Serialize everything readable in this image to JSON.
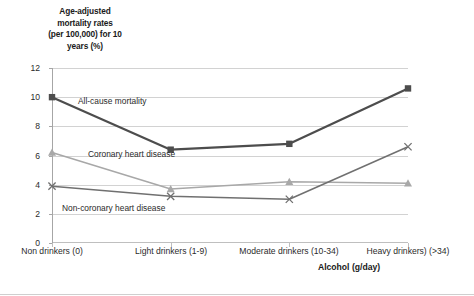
{
  "chart_data": {
    "type": "line",
    "title": "",
    "ylabel": "Age-adjusted mortality rates (per 100,000) for 10 years (%)",
    "ylabel_lines": [
      "Age-adjusted",
      "mortality rates",
      "(per 100,000) for 10",
      "years (%)"
    ],
    "xlabel": "Alcohol (g/day)",
    "categories": [
      "Non drinkers (0)",
      "Light drinkers (1-9)",
      "Moderate drinkers (10-34)",
      "Heavy drinkers) (>34)"
    ],
    "ylim": [
      0,
      12
    ],
    "yticks": [
      0,
      2,
      4,
      6,
      8,
      10,
      12
    ],
    "grid": true,
    "legend_position": "inline-annotations",
    "series": [
      {
        "name": "All-cause mortality",
        "marker": "square",
        "color": "#4d4d4d",
        "values": [
          10.0,
          6.4,
          6.8,
          10.6
        ]
      },
      {
        "name": "Coronary heart disease",
        "marker": "triangle",
        "color": "#a8a8a8",
        "values": [
          6.2,
          3.7,
          4.2,
          4.1
        ]
      },
      {
        "name": "Non-coronary heart disease",
        "marker": "x",
        "color": "#707070",
        "values": [
          3.9,
          3.2,
          3.0,
          6.6
        ]
      }
    ],
    "annotations": [
      "All-cause mortality",
      "Coronary heart disease",
      "Non-coronary heart disease"
    ]
  },
  "axis": {
    "y_tick_labels": [
      "12",
      "10",
      "8",
      "6",
      "4",
      "2",
      "0"
    ],
    "x_tick_labels": [
      "Non drinkers (0)",
      "Light drinkers (1-9)",
      "Moderate drinkers (10-34)",
      "Heavy drinkers) (>34)"
    ],
    "x_axis_title": "Alcohol (g/day)"
  },
  "colors": {
    "all_cause": "#4d4d4d",
    "coronary": "#a8a8a8",
    "non_coronary": "#707070",
    "gridline": "#d2d2d2",
    "background": "#ffffff"
  }
}
